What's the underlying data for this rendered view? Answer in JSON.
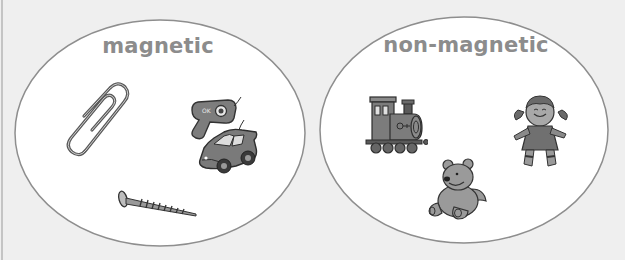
{
  "diagram": {
    "type": "sorting-sets",
    "background_color": "#efefef",
    "set_fill_color": "#ffffff",
    "set_outline_color": "#8e8e8e",
    "label_color": "#8c8c8c",
    "sets": [
      {
        "label": "magnetic",
        "items": [
          {
            "name": "paperclip",
            "icon": "paperclip-icon"
          },
          {
            "name": "key",
            "icon": "key-icon"
          },
          {
            "name": "toy car",
            "icon": "toy-car-icon"
          },
          {
            "name": "screw",
            "icon": "screw-icon"
          }
        ]
      },
      {
        "label": "non-magnetic",
        "items": [
          {
            "name": "toy train",
            "icon": "toy-train-icon"
          },
          {
            "name": "teddy bear",
            "icon": "teddy-bear-icon"
          },
          {
            "name": "doll",
            "icon": "doll-icon"
          }
        ]
      }
    ]
  }
}
